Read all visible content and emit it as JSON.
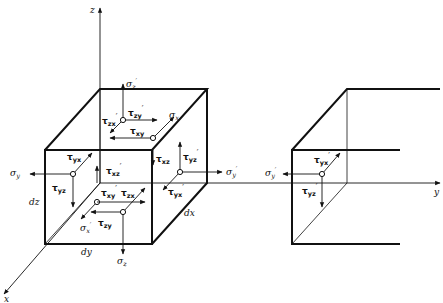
{
  "figure": {
    "axes": {
      "x": "x",
      "y": "y",
      "z": "z"
    },
    "dimensions": {
      "dx": "dx",
      "dy": "dy",
      "dz": "dz"
    },
    "labels": {
      "sigma_z_prime": {
        "base": "σ",
        "sub": "z",
        "prime": "′"
      },
      "tau_zy_prime": {
        "base": "τ",
        "sub": "zy",
        "prime": "′"
      },
      "tau_zx_prime": {
        "base": "τ",
        "sub": "zx",
        "prime": "′"
      },
      "sigma_x": {
        "base": "σ",
        "sub": "x",
        "prime": ""
      },
      "tau_xy": {
        "base": "τ",
        "sub": "xy",
        "prime": ""
      },
      "tau_yx": {
        "base": "τ",
        "sub": "yx",
        "prime": ""
      },
      "sigma_y": {
        "base": "σ",
        "sub": "y",
        "prime": ""
      },
      "tau_yz": {
        "base": "τ",
        "sub": "yz",
        "prime": ""
      },
      "tau_xz": {
        "base": "τ",
        "sub": "xz",
        "prime": ""
      },
      "tau_xz_prime": {
        "base": "τ",
        "sub": "xz",
        "prime": "′"
      },
      "tau_yz_prime": {
        "base": "τ",
        "sub": "yz",
        "prime": "′"
      },
      "sigma_y_prime": {
        "base": "σ",
        "sub": "y",
        "prime": "′"
      },
      "tau_yx_prime": {
        "base": "τ",
        "sub": "yx",
        "prime": "′"
      },
      "tau_xy_prime": {
        "base": "τ",
        "sub": "xy",
        "prime": "′"
      },
      "tau_zx": {
        "base": "τ",
        "sub": "zx",
        "prime": ""
      },
      "tau_zy": {
        "base": "τ",
        "sub": "zy",
        "prime": ""
      },
      "sigma_x_prime": {
        "base": "σ",
        "sub": "x",
        "prime": "′"
      },
      "sigma_z": {
        "base": "σ",
        "sub": "z",
        "prime": ""
      }
    },
    "cut_element": {
      "sigma_y_prime": {
        "base": "σ",
        "sub": "y",
        "prime": "′"
      },
      "tau_yx_prime": {
        "base": "τ",
        "sub": "yx",
        "prime": "′"
      },
      "tau_yz_prime": {
        "base": "τ",
        "sub": "yz",
        "prime": "′"
      }
    }
  }
}
